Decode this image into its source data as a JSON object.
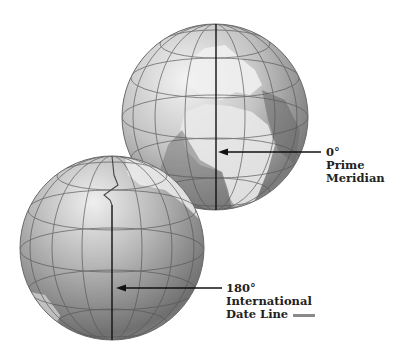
{
  "diagram": {
    "globes": [
      {
        "name": "eastern-hemisphere-globe",
        "view": "Europe and Africa",
        "line": "0°"
      },
      {
        "name": "pacific-hemisphere-globe",
        "view": "Pacific Ocean",
        "line": "180°"
      }
    ],
    "labels": {
      "prime_meridian": {
        "degree": "0°",
        "line1": "Prime",
        "line2": "Meridian"
      },
      "date_line": {
        "degree": "180°",
        "line1": "International",
        "line2": "Date Line"
      }
    },
    "colors": {
      "ocean_light": "#e6e6e6",
      "ocean_dark": "#7d7d7d",
      "land": "#f2f2f2",
      "grid": "#555555",
      "meridian_line": "#111111",
      "date_line_legend": "#8a8a8a"
    }
  }
}
